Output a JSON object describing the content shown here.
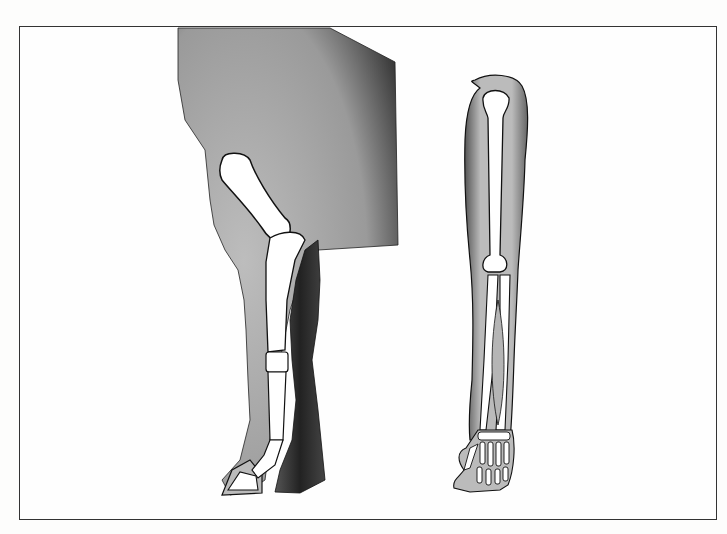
{
  "figure": {
    "panels": [
      {
        "id": "horse-foreleg",
        "label": ""
      },
      {
        "id": "human-arm",
        "label": ""
      }
    ],
    "colors": {
      "frame": "#333333",
      "flesh": "#b9b9b9",
      "shadow": "#2a2a2a",
      "bone": "#ffffff",
      "outline": "#111111",
      "background": "#fefefe"
    }
  }
}
